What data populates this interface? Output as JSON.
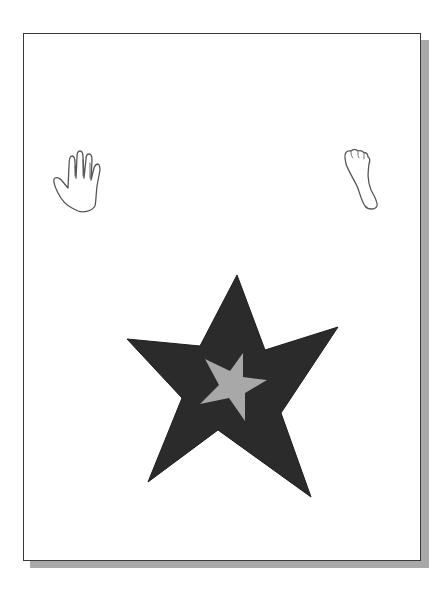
{
  "page": {
    "background": "#ffffff",
    "border_color": "#3a3a3a",
    "shadow_color": "#a9a9a9"
  },
  "icons": [
    {
      "name": "hand-icon",
      "label": "hand outline"
    },
    {
      "name": "foot-icon",
      "label": "foot outline"
    },
    {
      "name": "star-icon",
      "label": "large dark star with small gray star",
      "outer_color": "#2b2b2b",
      "inner_color": "#a8a8a8"
    }
  ]
}
